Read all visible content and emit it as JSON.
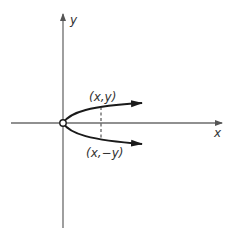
{
  "diagram": {
    "title": "",
    "axes": {
      "x_label": "x",
      "y_label": "y",
      "axis_color": "#6b6b6b"
    },
    "curve": {
      "description": "Parabola opening right, vertex at origin (x = y^2), symmetric about x-axis",
      "color": "#1a1a1a"
    },
    "points": [
      {
        "label": "(x,y)",
        "position": "upper branch"
      },
      {
        "label": "(x,−y)",
        "position": "lower branch"
      }
    ],
    "dashed_line": "vertical segment connecting (x,y) and (x,−y)",
    "origin_marker": "open circle at origin"
  }
}
